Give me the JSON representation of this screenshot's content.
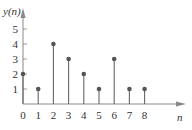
{
  "chart_data": {
    "type": "stem",
    "title": "",
    "xlabel": "n",
    "ylabel": "y(n)",
    "x": [
      0,
      1,
      2,
      3,
      4,
      5,
      6,
      7,
      8
    ],
    "values": [
      2,
      1,
      4,
      3,
      2,
      1,
      3,
      1,
      1
    ],
    "x_ticks": [
      "0",
      "1",
      "2",
      "3",
      "4",
      "5",
      "6",
      "7",
      "8"
    ],
    "y_ticks": [
      "1",
      "2",
      "3",
      "4",
      "5"
    ],
    "ylim": [
      0,
      5.5
    ],
    "grid": false,
    "colors": {
      "stem": "#666666",
      "marker": "#555555",
      "axis": "#888888",
      "text": "#333333"
    }
  }
}
